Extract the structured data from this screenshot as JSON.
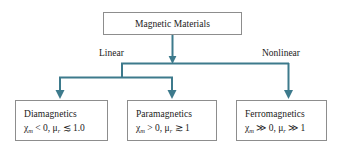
{
  "diagram": {
    "line_color": "#3d7a8c",
    "box_border_color": "#8d8d8d",
    "text_color": "#1a1a1a",
    "root": {
      "label": "Magnetic Materials"
    },
    "branch_labels": {
      "left": "Linear",
      "right": "Nonlinear"
    },
    "leaves": [
      {
        "title": "Diamagnetics",
        "formula_chi_symbol": "χ",
        "formula_chi_sub": "m",
        "formula_chi_rel": "< 0,",
        "formula_mu_symbol": "μ",
        "formula_mu_sub": "r",
        "formula_mu_rel": "≲ 1.0",
        "formula_plain": "χm < 0, μr ≲ 1.0"
      },
      {
        "title": "Paramagnetics",
        "formula_chi_symbol": "χ",
        "formula_chi_sub": "m",
        "formula_chi_rel": "> 0,",
        "formula_mu_symbol": "μ",
        "formula_mu_sub": "r",
        "formula_mu_rel": "≳ 1",
        "formula_plain": "χm > 0, μr ≳ 1"
      },
      {
        "title": "Ferromagnetics",
        "formula_chi_symbol": "χ",
        "formula_chi_sub": "m",
        "formula_chi_rel": "≫ 0,",
        "formula_mu_symbol": "μ",
        "formula_mu_sub": "r",
        "formula_mu_rel": "≫ 1",
        "formula_plain": "χm ≫ 0, μr ≫ 1"
      }
    ]
  }
}
